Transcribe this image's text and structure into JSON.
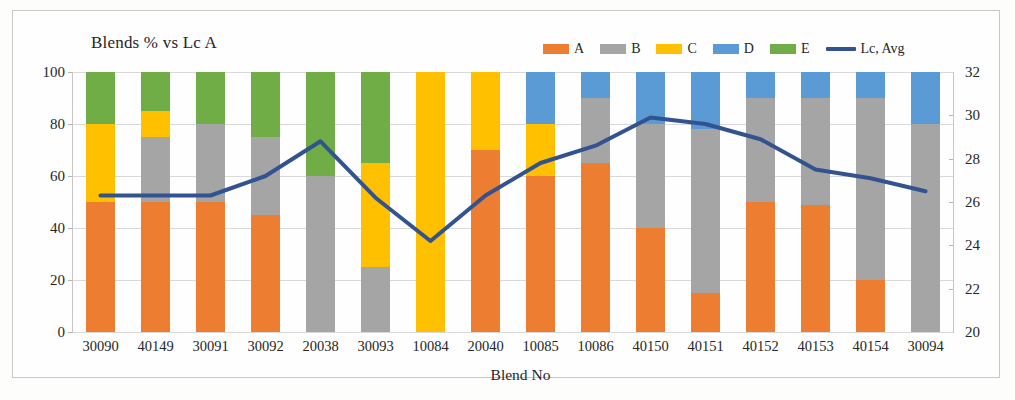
{
  "chart_data": {
    "type": "bar",
    "title": "Blends % vs Lc A",
    "xlabel": "Blend No",
    "ylabel": "",
    "ylim": [
      0,
      100
    ],
    "y2lim": [
      20,
      32
    ],
    "grid": true,
    "legend_position": "top-right",
    "stacked": true,
    "categories": [
      "30090",
      "40149",
      "30091",
      "30092",
      "20038",
      "30093",
      "10084",
      "20040",
      "10085",
      "10086",
      "40150",
      "40151",
      "40152",
      "40153",
      "40154",
      "30094"
    ],
    "yticks": [
      "100",
      "80",
      "60",
      "40",
      "20",
      "0"
    ],
    "y2ticks": [
      "32",
      "30",
      "28",
      "26",
      "24",
      "22",
      "20"
    ],
    "series": [
      {
        "name": "A",
        "color": "#ED7D31",
        "values": [
          50,
          50,
          50,
          45,
          0,
          0,
          0,
          70,
          60,
          65,
          40,
          15,
          50,
          49,
          20,
          0
        ]
      },
      {
        "name": "B",
        "color": "#A5A5A5",
        "values": [
          0,
          25,
          30,
          30,
          60,
          25,
          0,
          0,
          0,
          25,
          40,
          63,
          40,
          41,
          70,
          80
        ]
      },
      {
        "name": "C",
        "color": "#FFC000",
        "values": [
          30,
          10,
          0,
          0,
          0,
          40,
          100,
          30,
          20,
          0,
          0,
          0,
          0,
          0,
          0,
          0
        ]
      },
      {
        "name": "D",
        "color": "#5B9BD5",
        "values": [
          0,
          0,
          0,
          0,
          0,
          0,
          0,
          0,
          20,
          10,
          20,
          22,
          10,
          10,
          10,
          20
        ]
      },
      {
        "name": "E",
        "color": "#70AD47",
        "values": [
          20,
          15,
          20,
          25,
          40,
          35,
          0,
          0,
          0,
          0,
          0,
          0,
          0,
          0,
          0,
          0
        ]
      }
    ],
    "line_series": {
      "name": "Lc, Avg",
      "color": "#32538F",
      "axis": "secondary",
      "values": [
        26.3,
        26.3,
        26.3,
        27.2,
        28.8,
        26.2,
        24.2,
        26.3,
        27.8,
        28.6,
        29.9,
        29.6,
        28.9,
        27.5,
        27.1,
        26.5
      ]
    }
  },
  "legend": {
    "items": [
      {
        "label": "A",
        "type": "swatch"
      },
      {
        "label": "B",
        "type": "swatch"
      },
      {
        "label": "C",
        "type": "swatch"
      },
      {
        "label": "D",
        "type": "swatch"
      },
      {
        "label": "E",
        "type": "swatch"
      },
      {
        "label": "Lc, Avg",
        "type": "line"
      }
    ]
  }
}
